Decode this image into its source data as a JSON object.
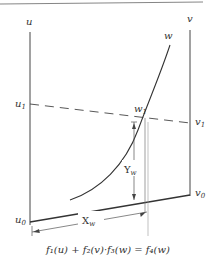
{
  "diagram": {
    "type": "nomogram",
    "formula": "f₁(u) + f₂(v)·f₃(w) = f₄(w)",
    "scales": {
      "u": {
        "label": "u",
        "ticks": [
          {
            "label": "u",
            "sub": "1"
          },
          {
            "label": "u",
            "sub": "0"
          }
        ]
      },
      "v": {
        "label": "v",
        "ticks": [
          {
            "label": "v",
            "sub": "1"
          },
          {
            "label": "v",
            "sub": "0"
          }
        ]
      },
      "w": {
        "label": "w",
        "ticks": [
          {
            "label": "w",
            "sub": "1"
          }
        ]
      }
    },
    "dimensions": {
      "x": {
        "label": "X",
        "sub": "w"
      },
      "y": {
        "label": "Y",
        "sub": "w"
      }
    },
    "colors": {
      "line": "#333333",
      "background": "#ffffff"
    }
  }
}
